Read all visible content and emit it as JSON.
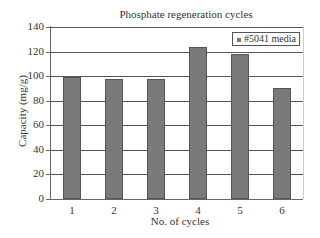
{
  "chart_data": {
    "type": "bar",
    "title": "Phosphate regeneration cycles",
    "xlabel": "No. of cycles",
    "ylabel": "Capacity (mg/g)",
    "categories": [
      "1",
      "2",
      "3",
      "4",
      "5",
      "6"
    ],
    "series": [
      {
        "name": "#5041 media",
        "values": [
          99,
          98,
          98,
          124,
          118,
          90
        ],
        "color": "#7a7a7a"
      }
    ],
    "ylim": [
      0,
      140
    ],
    "yticks": [
      "0",
      "20",
      "40",
      "60",
      "80",
      "100",
      "120",
      "140"
    ],
    "grid": true,
    "legend_position": "top-right"
  }
}
